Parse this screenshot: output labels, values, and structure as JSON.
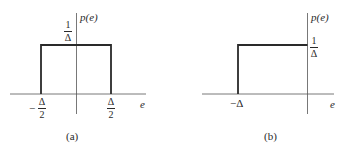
{
  "figure_a": {
    "caption": "(a)",
    "y_axis_label": "p(e)",
    "x_axis_label": "e",
    "height_label": {
      "numerator": "1",
      "denominator": "Δ"
    },
    "left_tick": {
      "sign": "−",
      "numerator": "Δ",
      "denominator": "2"
    },
    "right_tick": {
      "numerator": "Δ",
      "denominator": "2"
    },
    "description": "Uniform density on [−Δ/2, Δ/2] with height 1/Δ"
  },
  "figure_b": {
    "caption": "(b)",
    "y_axis_label": "p(e)",
    "x_axis_label": "e",
    "height_label": {
      "numerator": "1",
      "denominator": "Δ"
    },
    "left_tick": "−Δ",
    "description": "Uniform density on [−Δ, 0] with height 1/Δ"
  },
  "colors": {
    "stroke": "#2a2a2a",
    "background": "#ffffff"
  }
}
